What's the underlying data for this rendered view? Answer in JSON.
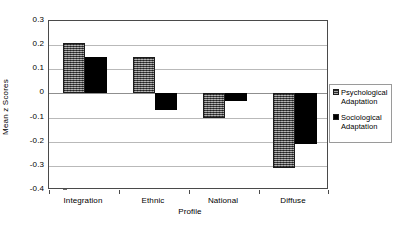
{
  "chart_data": {
    "type": "bar",
    "title": "",
    "xlabel": "Profile",
    "ylabel": "Mean z Scores",
    "categories": [
      "Integration",
      "Ethnic",
      "National",
      "Diffuse"
    ],
    "series": [
      {
        "name": "Psychological Adaptation",
        "values": [
          0.21,
          0.15,
          -0.1,
          -0.31
        ],
        "color": "#6e6e6e",
        "pattern": "hatched"
      },
      {
        "name": "Sociological Adaptation",
        "values": [
          0.15,
          -0.07,
          -0.03,
          -0.21
        ],
        "color": "#000000",
        "pattern": "solid"
      }
    ],
    "ylim": [
      -0.4,
      0.3
    ],
    "ytick_labels": [
      "0.3",
      "0.2",
      "0.1",
      "0",
      "-0.1",
      "-0.2",
      "-0.3",
      "-0.4"
    ],
    "ytick_values": [
      0.3,
      0.2,
      0.1,
      0,
      -0.1,
      -0.2,
      -0.3,
      -0.4
    ],
    "grid": true,
    "legend_position": "right"
  },
  "legend": {
    "entries": [
      {
        "label": "Psychological Adaptation",
        "swatch": "psych"
      },
      {
        "label": "Sociological Adaptation",
        "swatch": "socio"
      }
    ]
  }
}
